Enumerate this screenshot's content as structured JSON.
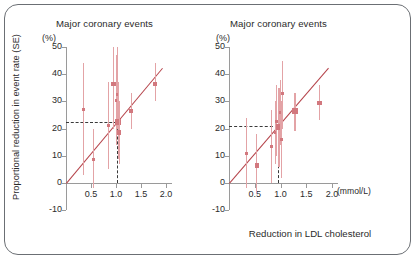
{
  "figure": {
    "xlabel": "Reduction in LDL cholesterol",
    "ylabel": "Proportional reduction in event rate (SE)",
    "x_unit": "(mmol/L)",
    "y_unit_left": "(%)",
    "y_unit_right": "(%)"
  },
  "panels": [
    {
      "id": "left",
      "title": "Major coronary events"
    },
    {
      "id": "right",
      "title": "Major coronary events"
    }
  ],
  "axes": {
    "y_ticks": [
      "50",
      "40",
      "30",
      "20",
      "10",
      "0",
      "-10"
    ],
    "x_ticks": [
      "0.5",
      "1.0",
      "1.5",
      "2.0"
    ]
  },
  "chart_data": [
    {
      "type": "scatter",
      "panel": "left",
      "title": "Major coronary events",
      "xlabel": "Reduction in LDL cholesterol",
      "ylabel": "Proportional reduction in event rate (SE)",
      "x_unit": "mmol/L",
      "y_unit": "%",
      "xlim": [
        0,
        2.0
      ],
      "ylim": [
        -10,
        50
      ],
      "xticks": [
        0.5,
        1.0,
        1.5,
        2.0
      ],
      "yticks": [
        -10,
        0,
        10,
        20,
        30,
        40,
        50
      ],
      "grid": false,
      "legend": "none",
      "reference_lines": {
        "horizontal_dashed_y": 22.5,
        "vertical_dashed_x": 1.02
      },
      "fit_line": {
        "intercept": 0,
        "slope": 22,
        "through_origin": true
      },
      "points": [
        {
          "x": 0.35,
          "y": 27.0,
          "err_low": 3.0,
          "err_high": 44.0,
          "size": "small"
        },
        {
          "x": 0.55,
          "y": 8.5,
          "err_low": -2.0,
          "err_high": 20.0,
          "size": "small"
        },
        {
          "x": 0.85,
          "y": 21.0,
          "err_low": 5.0,
          "err_high": 37.0,
          "size": "small"
        },
        {
          "x": 0.95,
          "y": 36.5,
          "err_low": 20.0,
          "err_high": 50.0,
          "size": "medium"
        },
        {
          "x": 1.0,
          "y": 30.5,
          "err_low": 14.0,
          "err_high": 47.0,
          "size": "small"
        },
        {
          "x": 1.02,
          "y": 32.5,
          "err_low": 20.0,
          "err_high": 50.0,
          "size": "small"
        },
        {
          "x": 1.04,
          "y": 22.5,
          "err_low": 9.0,
          "err_high": 37.0,
          "size": "large"
        },
        {
          "x": 1.06,
          "y": 18.5,
          "err_low": 7.0,
          "err_high": 30.0,
          "size": "medium"
        },
        {
          "x": 1.3,
          "y": 26.5,
          "err_low": 20.0,
          "err_high": 33.0,
          "size": "medium"
        },
        {
          "x": 1.78,
          "y": 36.5,
          "err_low": 30.0,
          "err_high": 44.0,
          "size": "medium"
        }
      ]
    },
    {
      "type": "scatter",
      "panel": "right",
      "title": "Major coronary events",
      "xlabel": "Reduction in LDL cholesterol",
      "ylabel": "Proportional reduction in event rate (SE)",
      "x_unit": "mmol/L",
      "y_unit": "%",
      "xlim": [
        0,
        2.0
      ],
      "ylim": [
        -10,
        50
      ],
      "xticks": [
        0.5,
        1.0,
        1.5,
        2.0
      ],
      "yticks": [
        -10,
        0,
        10,
        20,
        30,
        40,
        50
      ],
      "grid": false,
      "legend": "none",
      "reference_lines": {
        "horizontal_dashed_y": 21.0,
        "vertical_dashed_x": 0.95
      },
      "fit_line": {
        "intercept": 0,
        "slope": 22,
        "through_origin": true
      },
      "points": [
        {
          "x": 0.34,
          "y": 11.0,
          "err_low": -2.0,
          "err_high": 24.0,
          "size": "small"
        },
        {
          "x": 0.54,
          "y": 6.5,
          "err_low": -4.0,
          "err_high": 18.0,
          "size": "medium"
        },
        {
          "x": 0.83,
          "y": 13.5,
          "err_low": 0.0,
          "err_high": 27.0,
          "size": "small"
        },
        {
          "x": 0.9,
          "y": 18.5,
          "err_low": 7.0,
          "err_high": 30.0,
          "size": "small"
        },
        {
          "x": 0.93,
          "y": 22.5,
          "err_low": 10.0,
          "err_high": 36.0,
          "size": "small"
        },
        {
          "x": 0.97,
          "y": 20.5,
          "err_low": 6.0,
          "err_high": 35.0,
          "size": "large"
        },
        {
          "x": 1.0,
          "y": 26.0,
          "err_low": 14.0,
          "err_high": 38.0,
          "size": "small"
        },
        {
          "x": 1.02,
          "y": 16.0,
          "err_low": 2.0,
          "err_high": 30.0,
          "size": "small"
        },
        {
          "x": 1.03,
          "y": 33.0,
          "err_low": 20.0,
          "err_high": 45.0,
          "size": "small"
        },
        {
          "x": 1.28,
          "y": 26.5,
          "err_low": 19.0,
          "err_high": 33.0,
          "size": "large"
        },
        {
          "x": 1.76,
          "y": 29.5,
          "err_low": 23.0,
          "err_high": 36.0,
          "size": "medium"
        }
      ]
    }
  ],
  "colors": {
    "line": "#b5434a",
    "marker": "#d2787e",
    "whisker": "#e3a3a6",
    "axis": "#9a9a9a",
    "text": "#2b2b2b",
    "border": "#6b6f74"
  }
}
